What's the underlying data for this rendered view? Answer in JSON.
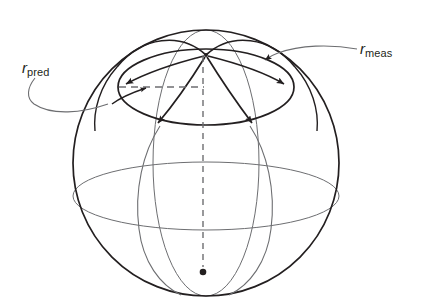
{
  "figure": {
    "type": "diagram",
    "background": "#ffffff",
    "stroke_dark": "#231f20",
    "stroke_light": "#6d6e71",
    "canvas": {
      "width": 425,
      "height": 307
    }
  },
  "labels": {
    "pred": {
      "symbol": "r",
      "subscript": "pred",
      "text": "r_pred"
    },
    "meas": {
      "symbol": "r",
      "subscript": "meas",
      "text": "r_meas"
    }
  },
  "geometry": {
    "sphere": {
      "cx": 206,
      "cy": 163,
      "r": 133,
      "stroke": "#231f20",
      "width": 1.6
    },
    "equator_ellipse": {
      "cx": 206,
      "cy": 196,
      "rx": 133,
      "ry": 34,
      "stroke": "#6d6e71",
      "width": 1.0
    },
    "cap_ellipse": {
      "cx": 206,
      "cy": 87,
      "rx": 88,
      "ry": 38,
      "stroke": "#231f20",
      "width": 1.6
    },
    "inner_meridian_ellipse": {
      "cx": 206,
      "cy": 163,
      "rx": 53,
      "ry": 133,
      "stroke": "#6d6e71",
      "width": 1.0
    },
    "pole_point": {
      "x": 206,
      "y": 55
    },
    "center_dot": {
      "x": 203,
      "y": 272,
      "r": 3.2,
      "fill": "#231f20"
    },
    "polar_axis_dashed": {
      "x": 203,
      "y1": 56,
      "y2": 269,
      "dash": "6,5",
      "stroke": "#6d6e71"
    },
    "cap_radius_dashed": {
      "x1": 119,
      "x2": 204,
      "y": 87,
      "dash": "7,5",
      "stroke": "#6d6e71"
    }
  },
  "arrows": {
    "cap_left": {
      "x": 121,
      "y": 85,
      "angle": 200,
      "note": "arrowhead on cap ellipse, left"
    },
    "cap_right": {
      "x": 288,
      "y": 86,
      "angle": 340,
      "note": "arrowhead on cap ellipse, right"
    },
    "meridian_left": {
      "x": 161,
      "y": 126,
      "angle": 115,
      "note": "arrowhead on left meridian geodesic"
    },
    "meridian_right": {
      "x": 249,
      "y": 126,
      "angle": 65,
      "note": "arrowhead on right meridian geodesic"
    },
    "pred_arc": {
      "x": 149,
      "y": 87,
      "angle": 310,
      "note": "small arrowhead on r_pred arc"
    },
    "meas_leader": {
      "x": 263,
      "y": 61,
      "angle": 210,
      "note": "arrowhead at end of r_meas leader"
    }
  }
}
